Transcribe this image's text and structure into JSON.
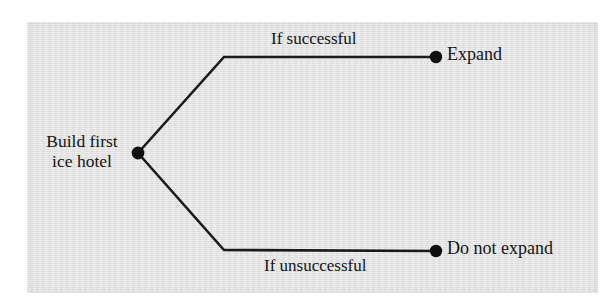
{
  "figure": {
    "type": "decision-tree",
    "background_color": "#e3e3e3",
    "page_color": "#ffffff",
    "line_color": "#1a1a1a",
    "text_color": "#141414"
  },
  "tree": {
    "root": {
      "label_line1": "Build first",
      "label_line2": "ice hotel",
      "node_x": 138,
      "node_y": 153
    },
    "branches": [
      {
        "id": "successful",
        "condition_label": "If successful",
        "outcome_label": "Expand",
        "elbow_x": 224,
        "elbow_y": 57,
        "end_x": 436,
        "end_y": 57,
        "condition_position": "above-line"
      },
      {
        "id": "unsuccessful",
        "condition_label": "If unsuccessful",
        "outcome_label": "Do not expand",
        "elbow_x": 224,
        "elbow_y": 250,
        "end_x": 436,
        "end_y": 251,
        "condition_position": "below-line"
      }
    ]
  }
}
